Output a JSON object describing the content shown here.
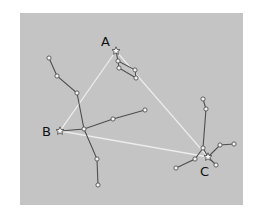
{
  "diagram": {
    "panel": {
      "x": 20,
      "y": 13,
      "width": 223,
      "height": 192,
      "color": "#c4c4c4"
    },
    "vertices": [
      {
        "id": "A",
        "label": "A",
        "x": 116,
        "y": 51,
        "label_x": 101,
        "label_y": 46
      },
      {
        "id": "B",
        "label": "B",
        "x": 60,
        "y": 131,
        "label_x": 42,
        "label_y": 136
      },
      {
        "id": "C",
        "label": "C",
        "x": 208,
        "y": 157,
        "label_x": 200,
        "label_y": 176
      }
    ],
    "triangle_color": "#ededed",
    "constellation_color": "#4e4e4e",
    "constellations": [
      {
        "name": "near-A",
        "points": [
          [
            116,
            51
          ],
          [
            118,
            61
          ],
          [
            135,
            70
          ],
          [
            136,
            78
          ],
          [
            119,
            68
          ],
          [
            118,
            61
          ]
        ]
      },
      {
        "name": "cross-main",
        "points": [
          [
            49,
            58
          ],
          [
            57,
            76
          ],
          [
            77,
            93
          ],
          [
            84,
            129
          ],
          [
            97,
            159
          ],
          [
            98,
            185
          ]
        ]
      },
      {
        "name": "cross-arm",
        "points": [
          [
            60,
            131
          ],
          [
            84,
            129
          ],
          [
            113,
            119
          ],
          [
            145,
            110
          ]
        ]
      },
      {
        "name": "near-C-stem",
        "points": [
          [
            203,
            99
          ],
          [
            206,
            109
          ],
          [
            203,
            148
          ],
          [
            208,
            157
          ]
        ]
      },
      {
        "name": "near-C-right",
        "points": [
          [
            208,
            157
          ],
          [
            220,
            145
          ],
          [
            234,
            144
          ]
        ]
      },
      {
        "name": "near-C-left",
        "points": [
          [
            203,
            148
          ],
          [
            195,
            159
          ],
          [
            176,
            168
          ]
        ]
      },
      {
        "name": "near-C-tail",
        "points": [
          [
            208,
            157
          ],
          [
            216,
            165
          ]
        ]
      }
    ],
    "dots": [
      [
        118,
        61
      ],
      [
        135,
        70
      ],
      [
        136,
        78
      ],
      [
        119,
        68
      ],
      [
        49,
        58
      ],
      [
        57,
        76
      ],
      [
        77,
        93
      ],
      [
        84,
        129
      ],
      [
        97,
        159
      ],
      [
        98,
        185
      ],
      [
        113,
        119
      ],
      [
        145,
        110
      ],
      [
        203,
        99
      ],
      [
        206,
        109
      ],
      [
        203,
        148
      ],
      [
        220,
        145
      ],
      [
        234,
        144
      ],
      [
        195,
        159
      ],
      [
        176,
        168
      ],
      [
        216,
        165
      ]
    ]
  }
}
